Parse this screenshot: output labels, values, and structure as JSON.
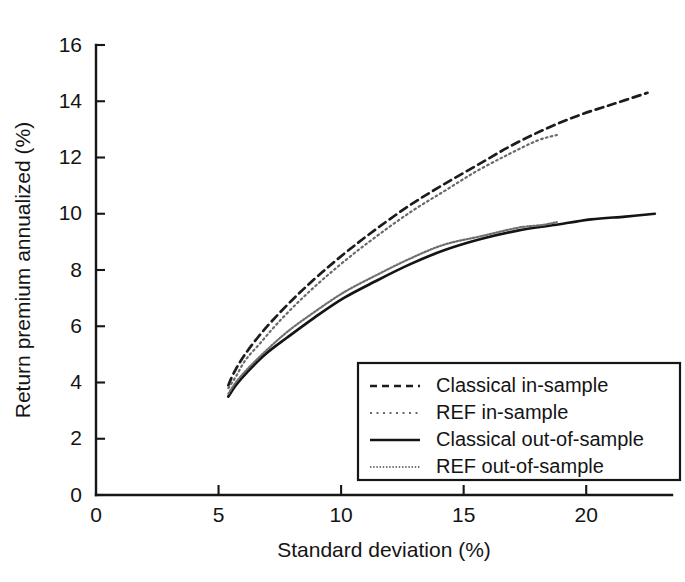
{
  "chart_data": {
    "type": "line",
    "title": "",
    "xlabel": "Standard deviation (%)",
    "ylabel": "Return premium annualized (%)",
    "xlim": [
      0,
      23.5
    ],
    "ylim": [
      0,
      16
    ],
    "xticks": [
      0,
      5,
      10,
      15,
      20
    ],
    "yticks": [
      0,
      2,
      4,
      6,
      8,
      10,
      12,
      14,
      16
    ],
    "xtick_labels": [
      "0",
      "5",
      "10",
      "15",
      "20"
    ],
    "ytick_labels": [
      "0",
      "2",
      "4",
      "6",
      "8",
      "10",
      "12",
      "14",
      "16"
    ],
    "grid": false,
    "legend_position": "lower-right-inside",
    "series": [
      {
        "name": "Classical in-sample",
        "style": "dashed",
        "color": "#1c1c1c",
        "x": [
          5.4,
          5.6,
          6.0,
          6.6,
          7.3,
          8.2,
          9.2,
          10.3,
          11.5,
          12.8,
          14.1,
          15.5,
          16.9,
          18.3,
          19.7,
          21.1,
          22.5
        ],
        "y": [
          3.9,
          4.3,
          4.9,
          5.6,
          6.3,
          7.1,
          7.9,
          8.7,
          9.5,
          10.3,
          11.0,
          11.7,
          12.4,
          13.0,
          13.5,
          13.9,
          14.3
        ]
      },
      {
        "name": "REF in-sample",
        "style": "dotted",
        "color": "#6a6a6a",
        "x": [
          5.4,
          5.7,
          6.1,
          6.7,
          7.4,
          8.3,
          9.3,
          10.4,
          11.6,
          12.9,
          14.2,
          15.5,
          16.8,
          18.0,
          18.8
        ],
        "y": [
          3.8,
          4.2,
          4.8,
          5.4,
          6.1,
          6.9,
          7.7,
          8.5,
          9.3,
          10.1,
          10.8,
          11.5,
          12.1,
          12.6,
          12.8
        ]
      },
      {
        "name": "Classical out-of-sample",
        "style": "solid",
        "color": "#141414",
        "x": [
          5.4,
          5.7,
          6.2,
          6.9,
          7.8,
          8.9,
          10.1,
          11.4,
          12.8,
          14.2,
          15.7,
          17.2,
          18.7,
          20.2,
          21.6,
          22.8
        ],
        "y": [
          3.5,
          3.9,
          4.4,
          5.0,
          5.6,
          6.3,
          7.0,
          7.6,
          8.2,
          8.7,
          9.1,
          9.4,
          9.6,
          9.8,
          9.9,
          10.0
        ]
      },
      {
        "name": "REF out-of-sample",
        "style": "fine-dotted",
        "color": "#6f6f6f",
        "x": [
          5.4,
          5.7,
          6.2,
          6.9,
          7.8,
          8.9,
          10.1,
          11.4,
          12.8,
          14.2,
          15.7,
          17.2,
          18.2,
          18.8
        ],
        "y": [
          3.6,
          4.0,
          4.5,
          5.1,
          5.8,
          6.5,
          7.2,
          7.8,
          8.4,
          8.9,
          9.2,
          9.5,
          9.6,
          9.7
        ]
      }
    ]
  },
  "legend": {
    "entries": [
      {
        "label": "Classical in-sample",
        "style": "dashed"
      },
      {
        "label": "REF in-sample",
        "style": "dotted"
      },
      {
        "label": "Classical out-of-sample",
        "style": "solid"
      },
      {
        "label": "REF out-of-sample",
        "style": "fine-dotted"
      }
    ]
  }
}
